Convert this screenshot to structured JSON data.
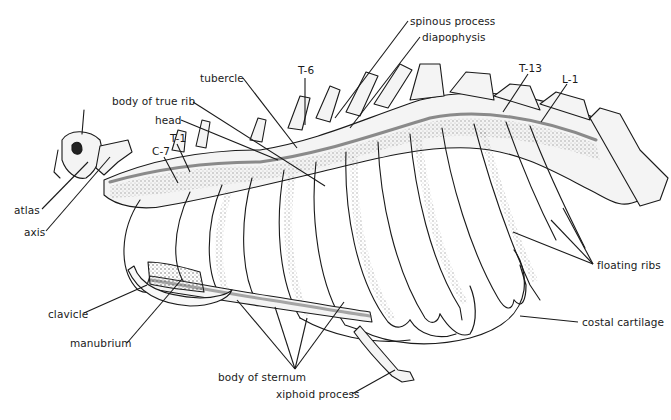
{
  "figure": {
    "labels": [
      {
        "id": "spinous-process",
        "text": "spinous process",
        "x": 408,
        "y": 16,
        "tx": 335,
        "ty": 118
      },
      {
        "id": "diapophysis",
        "text": "diapophysis",
        "x": 420,
        "y": 32,
        "tx": 350,
        "ty": 128
      },
      {
        "id": "tubercle",
        "text": "tubercle",
        "x": 200,
        "y": 72,
        "tx": 297,
        "ty": 148
      },
      {
        "id": "t-6",
        "text": "T-6",
        "x": 298,
        "y": 64,
        "tx": 305,
        "ty": 125
      },
      {
        "id": "body-of-true-rib",
        "text": "body of true rib",
        "x": 112,
        "y": 95,
        "tx": 325,
        "ty": 186
      },
      {
        "id": "head",
        "text": "head",
        "x": 155,
        "y": 114,
        "tx": 278,
        "ty": 160
      },
      {
        "id": "t-1",
        "text": "T-1",
        "x": 170,
        "y": 132,
        "tx": 190,
        "ty": 172
      },
      {
        "id": "c-7",
        "text": "C-7",
        "x": 152,
        "y": 145,
        "tx": 178,
        "ty": 183
      },
      {
        "id": "t-13",
        "text": "T-13",
        "x": 519,
        "y": 62,
        "tx": 503,
        "ty": 112
      },
      {
        "id": "l-1",
        "text": "L-1",
        "x": 562,
        "y": 73,
        "tx": 541,
        "ty": 122
      },
      {
        "id": "atlas",
        "text": "atlas",
        "x": 14,
        "y": 205,
        "tx": 88,
        "ty": 162
      },
      {
        "id": "axis",
        "text": "axis",
        "x": 24,
        "y": 227,
        "tx": 110,
        "ty": 157
      },
      {
        "id": "floating-ribs",
        "text": "floating ribs",
        "x": 597,
        "y": 260
      },
      {
        "id": "costal-cartilage",
        "text": "costal cartilage",
        "x": 582,
        "y": 316,
        "tx": 520,
        "ty": 316
      },
      {
        "id": "clavicle",
        "text": "clavicle",
        "x": 48,
        "y": 308,
        "tx": 147,
        "ty": 285
      },
      {
        "id": "manubrium",
        "text": "manubrium",
        "x": 70,
        "y": 337,
        "tx": 182,
        "ty": 279
      },
      {
        "id": "body-of-sternum",
        "text": "body of sternum",
        "x": 218,
        "y": 371
      },
      {
        "id": "xiphoid-process",
        "text": "xiphoid process",
        "x": 276,
        "y": 388,
        "tx": 395,
        "ty": 370
      }
    ],
    "multi_leaders": {
      "floating-ribs": {
        "origin": [
          593,
          264
        ],
        "targets": [
          [
            513,
            232
          ],
          [
            551,
            220
          ],
          [
            563,
            208
          ]
        ]
      },
      "body-of-sternum": {
        "origin": [
          295,
          369
        ],
        "targets": [
          [
            237,
            300
          ],
          [
            275,
            307
          ],
          [
            307,
            318
          ],
          [
            344,
            302
          ]
        ]
      }
    },
    "line_color": "#1a1a1a",
    "bone_fill": "#f4f4f4",
    "shade_color": "#6a6a6a"
  }
}
